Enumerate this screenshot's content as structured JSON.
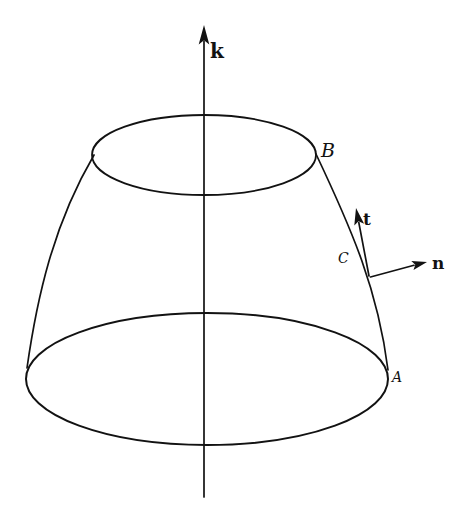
{
  "figure": {
    "background_color": "#ffffff",
    "line_color": "#121212",
    "labels": {
      "axis_vector": "k",
      "point_top": "B",
      "point_bottom": "A",
      "tangent_vector": "t",
      "normal_vector": "n",
      "curve_name": "C"
    }
  }
}
